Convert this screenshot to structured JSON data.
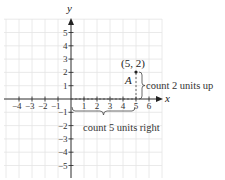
{
  "diagram": {
    "type": "coordinate-plane",
    "axes": {
      "x_label": "x",
      "y_label": "y",
      "x_ticks": [
        {
          "v": -4,
          "label": "−4"
        },
        {
          "v": -3,
          "label": "−3"
        },
        {
          "v": -2,
          "label": "−2"
        },
        {
          "v": -1,
          "label": "−1"
        },
        {
          "v": 1,
          "label": "1"
        },
        {
          "v": 2,
          "label": "2"
        },
        {
          "v": 3,
          "label": "3"
        },
        {
          "v": 4,
          "label": "4"
        },
        {
          "v": 5,
          "label": "5"
        },
        {
          "v": 6,
          "label": "6"
        }
      ],
      "y_ticks": [
        {
          "v": 5,
          "label": "5"
        },
        {
          "v": 4,
          "label": "4"
        },
        {
          "v": 3,
          "label": "3"
        },
        {
          "v": 2,
          "label": "2"
        },
        {
          "v": 1,
          "label": "1"
        },
        {
          "v": -1,
          "label": "−1"
        },
        {
          "v": -2,
          "label": "−2"
        },
        {
          "v": -3,
          "label": "−3"
        },
        {
          "v": -4,
          "label": "−4"
        },
        {
          "v": -5,
          "label": "−5"
        }
      ]
    },
    "point": {
      "name": "A",
      "coords_label": "(5, 2)",
      "x": 5,
      "y": 2
    },
    "annotations": {
      "vertical": "count 2 units up",
      "horizontal": "count 5 units right"
    },
    "colors": {
      "grid": "#e4e4e4",
      "axis": "#222222",
      "text": "#333333"
    }
  }
}
